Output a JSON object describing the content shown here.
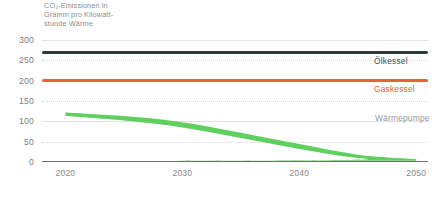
{
  "chart_data": {
    "type": "line",
    "title": "CO₂-Emissionen in\nGramm pro Kilowatt-\nstunde Wärme",
    "xlabel": "",
    "ylabel": "",
    "xlim": [
      2018,
      2051
    ],
    "ylim": [
      0,
      300
    ],
    "grid": true,
    "legend_position": "right-inline",
    "yticks": [
      300,
      250,
      200,
      150,
      100,
      50,
      0
    ],
    "xticks": [
      2020,
      2030,
      2040,
      2050
    ],
    "x": [
      2020,
      2025,
      2030,
      2035,
      2040,
      2045,
      2050
    ],
    "series": [
      {
        "name": "Ölkessel",
        "color": "#2b3d39",
        "label_color": "#41504c",
        "style": "line",
        "values": [
          270,
          270,
          270,
          270,
          270,
          270,
          270
        ]
      },
      {
        "name": "Gaskessel",
        "color": "#e8603c",
        "label_color": "#e8603c",
        "style": "line",
        "values": [
          201,
          201,
          201,
          201,
          201,
          201,
          201
        ]
      },
      {
        "name": "Wärmepumpe",
        "color": "#5fd05f",
        "label_color": "#9a9a9a",
        "style": "band",
        "values": [
          118,
          108,
          92,
          66,
          38,
          14,
          5
        ],
        "band_upper": [
          122,
          113,
          98,
          72,
          44,
          18,
          7
        ],
        "band_lower": [
          113,
          102,
          85,
          59,
          32,
          10,
          3
        ]
      }
    ]
  },
  "axis": {
    "ytick_labels": [
      "300",
      "250",
      "200",
      "150",
      "100",
      "50",
      "0"
    ],
    "xtick_labels": [
      "2020",
      "2030",
      "2040",
      "2050"
    ]
  },
  "legend": {
    "oil_label": "Ölkessel",
    "gas_label": "Gaskessel",
    "heatpump_label": "Wärmepumpe"
  },
  "colors": {
    "oil": "#2b3d39",
    "gas": "#e8603c",
    "heatpump": "#5fd05f",
    "grid": "#e2e2e2",
    "axis": "#6f6f6f",
    "tick_text": "#7d7d7d",
    "title_text": "#8d8d8d"
  }
}
